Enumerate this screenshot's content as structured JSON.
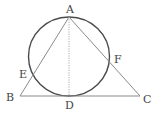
{
  "diagram": {
    "type": "geometry",
    "points": {
      "A": {
        "label": "A",
        "x": 69,
        "y": 17
      },
      "B": {
        "label": "B",
        "x": 20,
        "y": 96
      },
      "C": {
        "label": "C",
        "x": 140,
        "y": 96
      },
      "D": {
        "label": "D",
        "x": 69,
        "y": 96
      },
      "E": {
        "label": "E",
        "x": 31,
        "y": 75
      },
      "F": {
        "label": "F",
        "x": 109,
        "y": 62
      }
    },
    "circle": {
      "cx": 69,
      "cy": 56.5,
      "rx": 40.5,
      "ry": 39.5
    },
    "colors": {
      "triangle": "#8a8a8a",
      "circle": "#4a4a4a",
      "altitude": "#9a9a9a",
      "labels": "#444444"
    }
  }
}
